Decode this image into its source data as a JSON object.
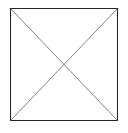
{
  "image": {
    "kind": "broken-image-placeholder",
    "alt_text": "",
    "caption": "",
    "canvas": {
      "width": 128,
      "height": 133,
      "background_color": "#ffffff"
    },
    "box": {
      "x": 10,
      "y": 8,
      "width": 108,
      "height": 113,
      "border_color": "#262626",
      "border_width": 1.5,
      "fill_color": "#ffffff"
    },
    "cross": {
      "stroke_color": "#808080",
      "stroke_width": 1,
      "diagonals": [
        {
          "name": "top-left-to-bottom-right",
          "x1": 0,
          "y1": 0,
          "x2": 108,
          "y2": 113
        },
        {
          "name": "top-right-to-bottom-left",
          "x1": 108,
          "y1": 0,
          "x2": 0,
          "y2": 113
        }
      ]
    }
  }
}
